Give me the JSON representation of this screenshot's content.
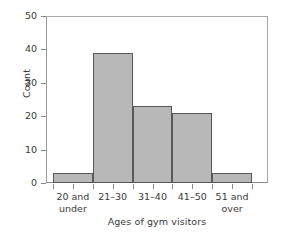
{
  "chart_data": {
    "type": "bar",
    "title": "",
    "subtitle": "",
    "xlabel": "Ages of gym visitors",
    "ylabel": "Count",
    "categories": [
      "20 and\nunder",
      "21–30",
      "31–40",
      "41–50",
      "51 and\nover"
    ],
    "values": [
      3,
      39,
      23,
      21,
      3
    ],
    "ylim": [
      0,
      50
    ],
    "yticks": [
      0,
      10,
      20,
      30,
      40,
      50
    ],
    "ytick_labels": [
      "0",
      "10",
      "20",
      "30",
      "40",
      "50"
    ],
    "grid": false,
    "legend": false,
    "legend_position": "none",
    "bar_fill_color": "#b8b8b8",
    "bar_edge_color": "#585858",
    "axis_color": "#8a8a8a",
    "background_color": "#ffffff",
    "text_color": "#3a3a3a"
  }
}
